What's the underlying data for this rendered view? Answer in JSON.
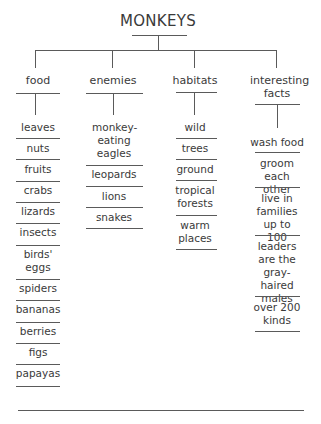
{
  "title": "MONKEYS",
  "categories": [
    {
      "label": "food",
      "items": [
        "leaves",
        "nuts",
        "fruits",
        "crabs",
        "lizards",
        "insects",
        "birds' eggs",
        "spiders",
        "bananas",
        "berries",
        "figs",
        "papayas"
      ]
    },
    {
      "label": "enemies",
      "items": [
        "monkey-eating eagles",
        "leopards",
        "lions",
        "snakes"
      ]
    },
    {
      "label": "habitats",
      "items": [
        "wild",
        "trees",
        "ground",
        "tropical forests",
        "warm places"
      ]
    },
    {
      "label": "interesting facts",
      "items": [
        "wash food",
        "groom each other",
        "live in families up to 100",
        "leaders are the gray-haired males",
        "over 200 kinds"
      ]
    }
  ]
}
